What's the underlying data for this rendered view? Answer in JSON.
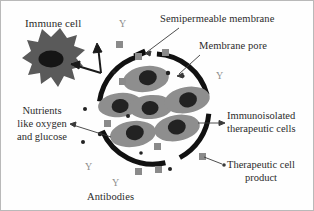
{
  "figure": {
    "kind": "biomedical-schematic",
    "title_text": "",
    "background": "#ffffff",
    "border_color": "#b9b9b9"
  },
  "palette": {
    "membrane": "#111111",
    "cell_body": "#8e8e8e",
    "cell_nucleus": "#222222",
    "immune_cell": "#5a5a5a",
    "immune_nucleus": "#151515",
    "product_square": "#8a8a8a",
    "nutrient_dot": "#222222",
    "antibody": "#8d8d8d",
    "leader_line": "#3a3a3a",
    "text": "#2b2b2b"
  },
  "labels": {
    "immune_cell": "Immune cell",
    "semipermeable_membrane": "Semipermeable membrane",
    "membrane_pore": "Membrane pore",
    "immunoisolated_line1": "Immunoisolated",
    "immunoisolated_line2": "therapeutic cells",
    "therapeutic_product_line1": "Therapeutic cell",
    "therapeutic_product_line2": "product",
    "nutrients_line1": "Nutrients",
    "nutrients_line2": "like oxygen",
    "nutrients_line3": "and glucose",
    "antibodies": "Antibodies"
  },
  "antibody_marks": [
    {
      "label": "Y",
      "x": 118,
      "y": 18
    },
    {
      "label": "Y",
      "x": 215,
      "y": 70
    },
    {
      "label": "Y",
      "x": 84,
      "y": 161
    },
    {
      "label": "Y",
      "x": 111,
      "y": 177
    }
  ],
  "capsule": {
    "center_x": 153,
    "center_y": 108,
    "radius": 55,
    "arc_stroke": 5,
    "arcs": [
      {
        "name": "arc-top-left",
        "start_deg": 188,
        "end_deg": 254
      },
      {
        "name": "arc-top-right",
        "start_deg": 272,
        "end_deg": 345
      },
      {
        "name": "arc-right-bottom",
        "start_deg": 5,
        "end_deg": 62
      },
      {
        "name": "arc-bottom-left",
        "start_deg": 78,
        "end_deg": 160
      }
    ]
  },
  "therapeutic_cells": [
    {
      "cx": 145,
      "cy": 78,
      "rx": 23,
      "ry": 13,
      "nx": 147,
      "ny": 77,
      "nrx": 9,
      "nry": 7.5,
      "rot": -8
    },
    {
      "cx": 119,
      "cy": 104,
      "rx": 22,
      "ry": 12,
      "nx": 119,
      "ny": 105,
      "nrx": 8.5,
      "nry": 7,
      "rot": -6
    },
    {
      "cx": 150,
      "cy": 106,
      "rx": 22,
      "ry": 12,
      "nx": 149,
      "ny": 107,
      "nrx": 8.5,
      "nry": 7,
      "rot": -4
    },
    {
      "cx": 186,
      "cy": 99,
      "rx": 23,
      "ry": 13,
      "nx": 187,
      "ny": 99,
      "nrx": 9,
      "nry": 7.5,
      "rot": -10
    },
    {
      "cx": 132,
      "cy": 133,
      "rx": 23,
      "ry": 13,
      "nx": 134,
      "ny": 132,
      "nrx": 9,
      "nry": 7.5,
      "rot": -8
    },
    {
      "cx": 176,
      "cy": 127,
      "rx": 23,
      "ry": 13,
      "nx": 176,
      "ny": 126,
      "nrx": 9,
      "nry": 7.5,
      "rot": -10
    }
  ],
  "product_squares": [
    {
      "x": 115,
      "y": 40,
      "size": 7
    },
    {
      "x": 134,
      "y": 52,
      "size": 7
    },
    {
      "x": 161,
      "y": 48,
      "size": 7
    },
    {
      "x": 118,
      "y": 77,
      "size": 7
    },
    {
      "x": 103,
      "y": 119,
      "size": 7
    },
    {
      "x": 153,
      "y": 142,
      "size": 7
    },
    {
      "x": 154,
      "y": 165,
      "size": 7
    },
    {
      "x": 134,
      "y": 167,
      "size": 7
    },
    {
      "x": 198,
      "y": 152,
      "size": 7
    }
  ],
  "nutrient_dots": [
    {
      "x": 167,
      "y": 72,
      "r": 2.2
    },
    {
      "x": 182,
      "y": 75,
      "r": 1.6
    },
    {
      "x": 84,
      "y": 108,
      "r": 2.0
    },
    {
      "x": 127,
      "y": 115,
      "r": 2.0
    },
    {
      "x": 99,
      "y": 133,
      "r": 2.2
    },
    {
      "x": 82,
      "y": 141,
      "r": 2.0
    },
    {
      "x": 140,
      "y": 152,
      "r": 1.8
    },
    {
      "x": 169,
      "y": 168,
      "r": 2.0
    },
    {
      "x": 113,
      "y": 71,
      "r": 1.8
    }
  ],
  "pores": [
    {
      "x": 137,
      "y": 54,
      "w": 10,
      "h": 5,
      "rot": -22
    }
  ]
}
